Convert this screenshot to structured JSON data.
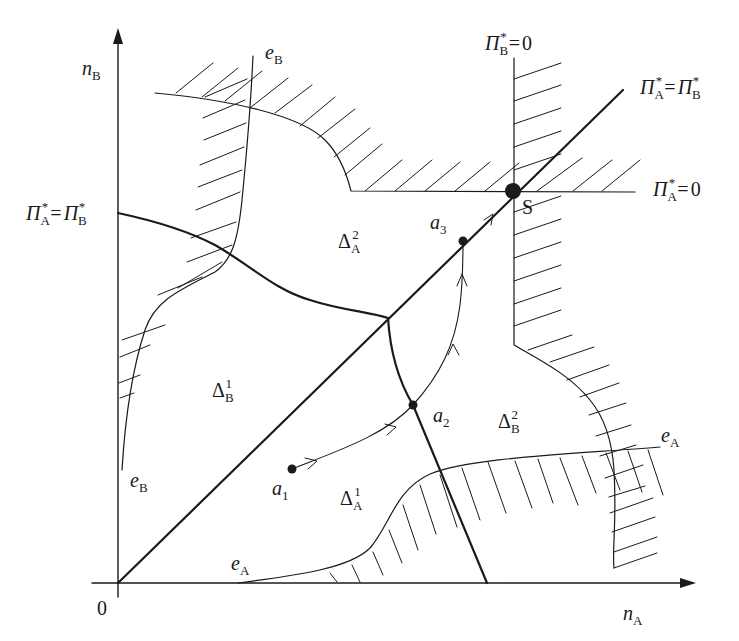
{
  "diagram": {
    "type": "phase-diagram",
    "axes": {
      "x": {
        "symbol": "n",
        "subscript": "A"
      },
      "y": {
        "symbol": "n",
        "subscript": "B"
      },
      "origin": "0"
    },
    "curves": {
      "eA_top": {
        "symbol": "e",
        "subscript": "A"
      },
      "eA_bottom": {
        "symbol": "e",
        "subscript": "A"
      },
      "eB_top": {
        "symbol": "e",
        "subscript": "B"
      },
      "eB_bottom": {
        "symbol": "e",
        "subscript": "B"
      },
      "piB_zero": {
        "lhs": "Π",
        "lhs_sub": "B",
        "star": "*",
        "eq": "=",
        "rhs": "0"
      },
      "piA_zero": {
        "lhs": "Π",
        "lhs_sub": "A",
        "star": "*",
        "eq": "=",
        "rhs": "0"
      },
      "equal_diag": {
        "lhs": "Π",
        "lhs_sub": "A",
        "star": "*",
        "eq": "=",
        "rhs": "Π",
        "rhs_sub": "B"
      },
      "equal_left": {
        "lhs": "Π",
        "lhs_sub": "A",
        "star": "*",
        "eq": "=",
        "rhs": "Π",
        "rhs_sub": "B"
      }
    },
    "regions": [
      {
        "id": "delta_A_2",
        "symbol": "Δ",
        "subscript": "A",
        "superscript": "2"
      },
      {
        "id": "delta_B_1",
        "symbol": "Δ",
        "subscript": "B",
        "superscript": "1"
      },
      {
        "id": "delta_A_1",
        "symbol": "Δ",
        "subscript": "A",
        "superscript": "1"
      },
      {
        "id": "delta_B_2",
        "symbol": "Δ",
        "subscript": "B",
        "superscript": "2"
      }
    ],
    "points": [
      {
        "id": "a1",
        "symbol": "a",
        "subscript": "1"
      },
      {
        "id": "a2",
        "symbol": "a",
        "subscript": "2"
      },
      {
        "id": "a3",
        "symbol": "a",
        "subscript": "3"
      },
      {
        "id": "S",
        "symbol": "S"
      }
    ],
    "colors": {
      "ink": "#1a1a1a",
      "background": "#ffffff"
    }
  }
}
